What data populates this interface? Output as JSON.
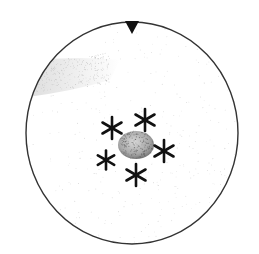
{
  "diagram": {
    "type": "circular-field-of-view",
    "colors": {
      "background": "#ffffff",
      "outline": "#333333",
      "marker": "#111111",
      "asterisk": "#111111",
      "stipple": "#9a9a9a",
      "blob": "#8a8a8a"
    },
    "field": {
      "cx": 132,
      "cy": 133,
      "rx": 106,
      "ry": 111
    },
    "orientation_marker": {
      "shape": "triangle-down",
      "x": 132,
      "y": 22
    },
    "central_mass": {
      "cx": 136,
      "cy": 145,
      "rx": 18,
      "ry": 14
    },
    "asterisks": [
      {
        "x": 112,
        "y": 128,
        "size": 11
      },
      {
        "x": 145,
        "y": 120,
        "size": 11
      },
      {
        "x": 164,
        "y": 151,
        "size": 11
      },
      {
        "x": 106,
        "y": 160,
        "size": 9.5
      },
      {
        "x": 136,
        "y": 175,
        "size": 11
      }
    ],
    "shaded_region": {
      "label": "upper-left stippled band"
    }
  }
}
